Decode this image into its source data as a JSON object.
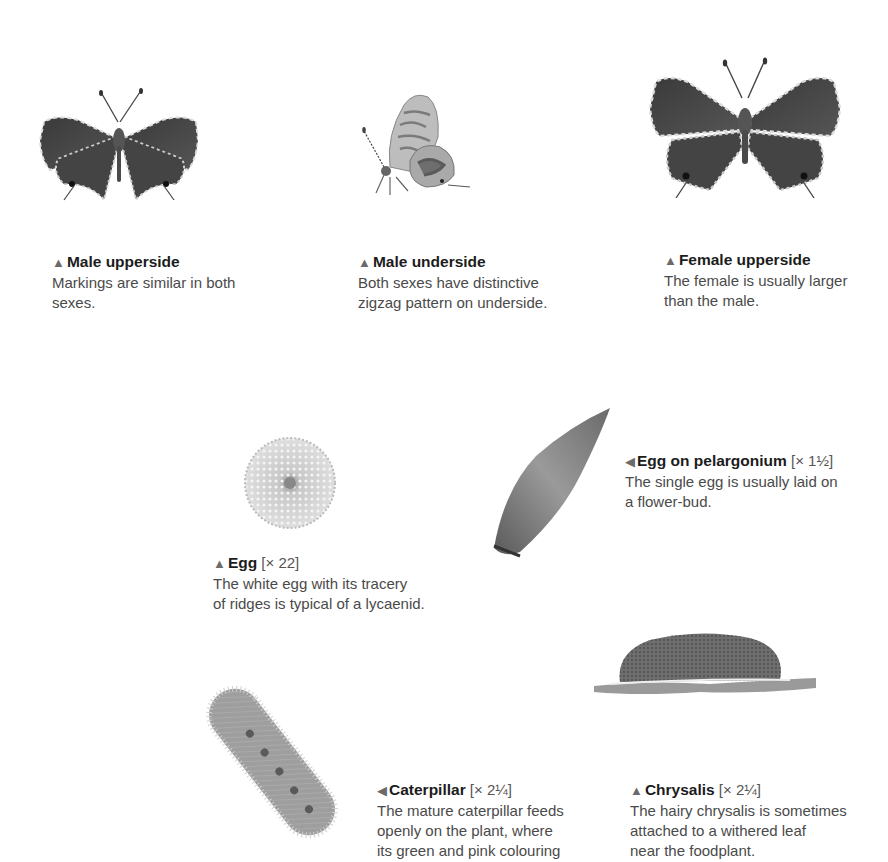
{
  "page": {
    "background": "#ffffff",
    "text_color": "#4a4a4a",
    "title_color": "#1c1c1c",
    "marker_color": "#6b6b6b"
  },
  "figures": [
    {
      "id": "male-upperside",
      "marker": "▲",
      "title": "Male upperside",
      "scale": "",
      "description_lines": [
        "Markings are similar in both",
        "sexes."
      ]
    },
    {
      "id": "male-underside",
      "marker": "▲",
      "title": "Male underside",
      "scale": "",
      "description_lines": [
        "Both sexes have distinctive",
        "zigzag pattern on underside."
      ]
    },
    {
      "id": "female-upperside",
      "marker": "▲",
      "title": "Female upperside",
      "scale": "",
      "description_lines": [
        "The female is usually larger",
        "than the male."
      ]
    },
    {
      "id": "egg",
      "marker": "▲",
      "title": "Egg",
      "scale": "[× 22]",
      "description_lines": [
        "The white egg with its tracery",
        "of ridges is typical of a lycaenid."
      ]
    },
    {
      "id": "egg-on-pelargonium",
      "marker": "◀",
      "title": "Egg on pelargonium",
      "scale": "[× 1½]",
      "description_lines": [
        "The single egg is usually laid on",
        "a flower-bud."
      ]
    },
    {
      "id": "caterpillar",
      "marker": "◀",
      "title": "Caterpillar",
      "scale": "[× 2¼]",
      "description_lines": [
        "The mature caterpillar feeds",
        "openly on the plant, where",
        "its green and pink colouring"
      ]
    },
    {
      "id": "chrysalis",
      "marker": "▲",
      "title": "Chrysalis",
      "scale": "[× 2¼]",
      "description_lines": [
        "The hairy chrysalis is sometimes",
        "attached to a withered leaf",
        "near the foodplant."
      ]
    }
  ]
}
